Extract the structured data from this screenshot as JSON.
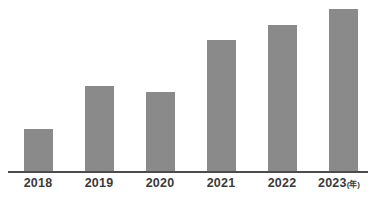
{
  "chart_data": {
    "type": "bar",
    "title": "",
    "subtitle": "",
    "xlabel": "",
    "ylabel": "",
    "categories": [
      "2018",
      "2019",
      "2020",
      "2021",
      "2022",
      "2023"
    ],
    "values": [
      44,
      87,
      81,
      133,
      148,
      164
    ],
    "ylim": [
      0,
      173
    ],
    "grid": false,
    "legend": null,
    "axis_unit_note": "(年)",
    "bar_color": "#8a8a8a",
    "axis_color": "#4c4c4c",
    "label_color": "#3a3a3a",
    "background": "#ffffff",
    "bars": [
      {
        "category": "2018",
        "value": 44,
        "left": 24,
        "width": 29,
        "top": 128
      },
      {
        "category": "2019",
        "value": 87,
        "left": 85,
        "width": 29,
        "top": 85
      },
      {
        "category": "2020",
        "value": 81,
        "left": 146,
        "width": 29,
        "top": 91
      },
      {
        "category": "2021",
        "value": 133,
        "left": 207,
        "width": 29,
        "top": 39
      },
      {
        "category": "2022",
        "value": 148,
        "left": 268,
        "width": 29,
        "top": 24
      },
      {
        "category": "2023",
        "value": 164,
        "left": 329,
        "width": 29,
        "top": 8
      }
    ],
    "tick_labels": [
      {
        "text": "2018",
        "unit": "",
        "left": 7
      },
      {
        "text": "2019",
        "unit": "",
        "left": 68
      },
      {
        "text": "2020",
        "unit": "",
        "left": 129
      },
      {
        "text": "2021",
        "unit": "",
        "left": 190
      },
      {
        "text": "2022",
        "unit": "",
        "left": 251
      },
      {
        "text": "2023",
        "unit": "(年)",
        "left": 308
      }
    ]
  }
}
